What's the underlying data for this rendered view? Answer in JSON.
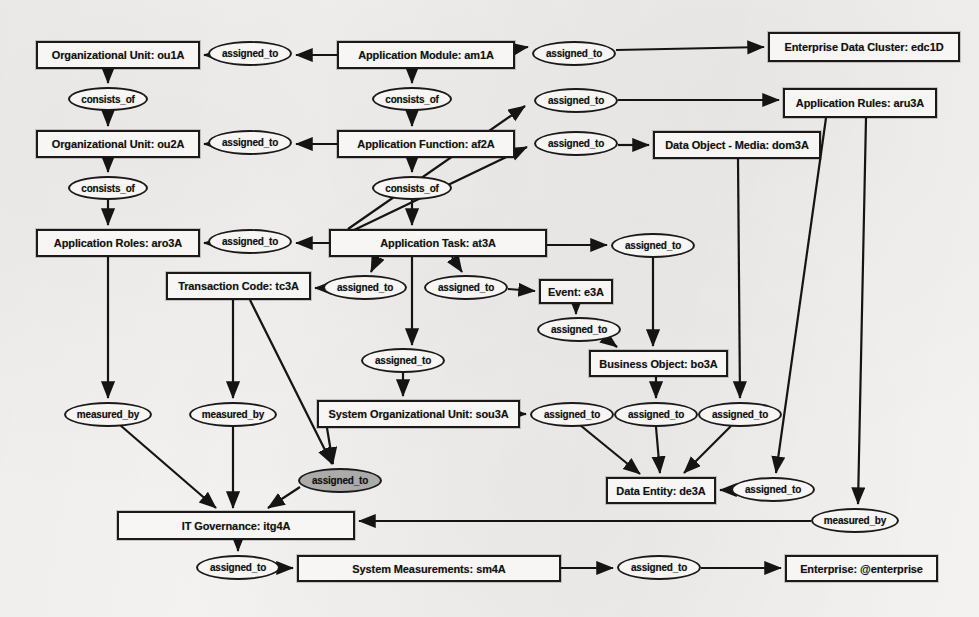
{
  "diagram": {
    "background_color": "#f2f0ee",
    "node_fill": "#f7f6f4",
    "node_stroke": "#1a1a1a",
    "edge_label_fill": "#f7f6f4",
    "edge_label_highlight_fill": "#ababab",
    "relation_labels": [
      "assigned_to",
      "consists_of",
      "measured_by"
    ],
    "nodes": [
      {
        "id": "ou1A",
        "label": "Organizational Unit: ou1A",
        "x": 36,
        "y": 41,
        "w": 164,
        "h": 28
      },
      {
        "id": "am1A",
        "label": "Application Module: am1A",
        "x": 337,
        "y": 41,
        "w": 178,
        "h": 28
      },
      {
        "id": "edc1D",
        "label": "Enterprise Data Cluster: edc1D",
        "x": 768,
        "y": 32,
        "w": 192,
        "h": 30
      },
      {
        "id": "ou2A",
        "label": "Organizational Unit: ou2A",
        "x": 36,
        "y": 130,
        "w": 164,
        "h": 28
      },
      {
        "id": "af2A",
        "label": "Application Function: af2A",
        "x": 337,
        "y": 130,
        "w": 178,
        "h": 28
      },
      {
        "id": "aru3A",
        "label": "Application Rules: aru3A",
        "x": 783,
        "y": 88,
        "w": 154,
        "h": 30
      },
      {
        "id": "dom3A",
        "label": "Data Object - Media: dom3A",
        "x": 653,
        "y": 131,
        "w": 168,
        "h": 28
      },
      {
        "id": "aro3A",
        "label": "Application Roles: aro3A",
        "x": 36,
        "y": 229,
        "w": 164,
        "h": 28
      },
      {
        "id": "at3A",
        "label": "Application Task: at3A",
        "x": 329,
        "y": 229,
        "w": 218,
        "h": 28
      },
      {
        "id": "tc3A",
        "label": "Transaction Code: tc3A",
        "x": 166,
        "y": 272,
        "w": 145,
        "h": 28
      },
      {
        "id": "e3A",
        "label": "Event: e3A",
        "x": 539,
        "y": 279,
        "w": 74,
        "h": 25
      },
      {
        "id": "bo3A",
        "label": "Business Object: bo3A",
        "x": 589,
        "y": 350,
        "w": 139,
        "h": 27
      },
      {
        "id": "sou3A",
        "label": "System Organizational Unit: sou3A",
        "x": 317,
        "y": 400,
        "w": 203,
        "h": 28
      },
      {
        "id": "de3A",
        "label": "Data Entity: de3A",
        "x": 606,
        "y": 477,
        "w": 110,
        "h": 27
      },
      {
        "id": "itg4A",
        "label": "IT Governance: itg4A",
        "x": 117,
        "y": 511,
        "w": 238,
        "h": 29
      },
      {
        "id": "sm4A",
        "label": "System Measurements: sm4A",
        "x": 297,
        "y": 555,
        "w": 264,
        "h": 27
      },
      {
        "id": "ent",
        "label": "Enterprise: @enterprise",
        "x": 785,
        "y": 555,
        "w": 153,
        "h": 27
      }
    ],
    "edge_labels": [
      {
        "id": "el1",
        "text": "assigned_to",
        "x": 208,
        "y": 41,
        "w": 84,
        "h": 25,
        "filled": false
      },
      {
        "id": "el2",
        "text": "assigned_to",
        "x": 532,
        "y": 41,
        "w": 84,
        "h": 25,
        "filled": false
      },
      {
        "id": "el3",
        "text": "consists_of",
        "x": 68,
        "y": 87,
        "w": 80,
        "h": 24,
        "filled": false
      },
      {
        "id": "el4",
        "text": "consists_of",
        "x": 372,
        "y": 87,
        "w": 80,
        "h": 24,
        "filled": false
      },
      {
        "id": "el5",
        "text": "assigned_to",
        "x": 534,
        "y": 88,
        "w": 84,
        "h": 25,
        "filled": false
      },
      {
        "id": "el6",
        "text": "assigned_to",
        "x": 208,
        "y": 130,
        "w": 84,
        "h": 25,
        "filled": false
      },
      {
        "id": "el7",
        "text": "assigned_to",
        "x": 534,
        "y": 131,
        "w": 84,
        "h": 25,
        "filled": false
      },
      {
        "id": "el8",
        "text": "consists_of",
        "x": 68,
        "y": 176,
        "w": 80,
        "h": 24,
        "filled": false
      },
      {
        "id": "el9",
        "text": "consists_of",
        "x": 372,
        "y": 176,
        "w": 80,
        "h": 24,
        "filled": false
      },
      {
        "id": "el10",
        "text": "assigned_to",
        "x": 208,
        "y": 229,
        "w": 84,
        "h": 25,
        "filled": false
      },
      {
        "id": "el11",
        "text": "assigned_to",
        "x": 611,
        "y": 233,
        "w": 84,
        "h": 25,
        "filled": false
      },
      {
        "id": "el12",
        "text": "assigned_to",
        "x": 323,
        "y": 275,
        "w": 84,
        "h": 25,
        "filled": false
      },
      {
        "id": "el13",
        "text": "assigned_to",
        "x": 424,
        "y": 275,
        "w": 84,
        "h": 25,
        "filled": false
      },
      {
        "id": "el14",
        "text": "assigned_to",
        "x": 537,
        "y": 317,
        "w": 84,
        "h": 25,
        "filled": false
      },
      {
        "id": "el15",
        "text": "assigned_to",
        "x": 361,
        "y": 348,
        "w": 84,
        "h": 25,
        "filled": false
      },
      {
        "id": "el16",
        "text": "measured_by",
        "x": 64,
        "y": 402,
        "w": 88,
        "h": 25,
        "filled": false
      },
      {
        "id": "el17",
        "text": "measured_by",
        "x": 189,
        "y": 402,
        "w": 88,
        "h": 25,
        "filled": false
      },
      {
        "id": "el18",
        "text": "assigned_to",
        "x": 530,
        "y": 402,
        "w": 84,
        "h": 25,
        "filled": false
      },
      {
        "id": "el19",
        "text": "assigned_to",
        "x": 614,
        "y": 402,
        "w": 84,
        "h": 25,
        "filled": false
      },
      {
        "id": "el20",
        "text": "assigned_to",
        "x": 698,
        "y": 402,
        "w": 84,
        "h": 25,
        "filled": false
      },
      {
        "id": "el21",
        "text": "assigned_to",
        "x": 298,
        "y": 468,
        "w": 84,
        "h": 25,
        "filled": true
      },
      {
        "id": "el22",
        "text": "assigned_to",
        "x": 731,
        "y": 477,
        "w": 84,
        "h": 25,
        "filled": false
      },
      {
        "id": "el23",
        "text": "measured_by",
        "x": 811,
        "y": 508,
        "w": 88,
        "h": 25,
        "filled": false
      },
      {
        "id": "el24",
        "text": "assigned_to",
        "x": 196,
        "y": 555,
        "w": 84,
        "h": 25,
        "filled": false
      },
      {
        "id": "el25",
        "text": "assigned_to",
        "x": 617,
        "y": 555,
        "w": 84,
        "h": 25,
        "filled": false
      }
    ],
    "edges": [
      {
        "from": "am1A",
        "to": "el1",
        "relation": "assigned_to"
      },
      {
        "from": "el1",
        "to": "ou1A",
        "relation": "assigned_to"
      },
      {
        "from": "am1A",
        "to": "el2",
        "relation": "assigned_to"
      },
      {
        "from": "el2",
        "to": "edc1D",
        "relation": "assigned_to"
      },
      {
        "from": "ou1A",
        "to": "el3",
        "relation": "consists_of"
      },
      {
        "from": "el3",
        "to": "ou2A",
        "relation": "consists_of"
      },
      {
        "from": "am1A",
        "to": "el4",
        "relation": "consists_of"
      },
      {
        "from": "el4",
        "to": "af2A",
        "relation": "consists_of"
      },
      {
        "from": "at3A",
        "to": "el5",
        "relation": "assigned_to"
      },
      {
        "from": "el5",
        "to": "aru3A",
        "relation": "assigned_to"
      },
      {
        "from": "af2A",
        "to": "el6",
        "relation": "assigned_to"
      },
      {
        "from": "el6",
        "to": "ou2A",
        "relation": "assigned_to"
      },
      {
        "from": "at3A",
        "to": "el7",
        "relation": "assigned_to"
      },
      {
        "from": "el7",
        "to": "dom3A",
        "relation": "assigned_to"
      },
      {
        "from": "ou2A",
        "to": "el8",
        "relation": "consists_of"
      },
      {
        "from": "el8",
        "to": "aro3A",
        "relation": "consists_of"
      },
      {
        "from": "af2A",
        "to": "el9",
        "relation": "consists_of"
      },
      {
        "from": "el9",
        "to": "at3A",
        "relation": "consists_of"
      },
      {
        "from": "at3A",
        "to": "el10",
        "relation": "assigned_to"
      },
      {
        "from": "el10",
        "to": "aro3A",
        "relation": "assigned_to"
      },
      {
        "from": "at3A",
        "to": "el11",
        "relation": "assigned_to"
      },
      {
        "from": "el11",
        "to": "bo3A",
        "relation": "assigned_to"
      },
      {
        "from": "at3A",
        "to": "el12",
        "relation": "assigned_to"
      },
      {
        "from": "el12",
        "to": "tc3A",
        "relation": "assigned_to"
      },
      {
        "from": "at3A",
        "to": "el13",
        "relation": "assigned_to"
      },
      {
        "from": "el13",
        "to": "e3A",
        "relation": "assigned_to"
      },
      {
        "from": "e3A",
        "to": "el14",
        "relation": "assigned_to"
      },
      {
        "from": "el14",
        "to": "bo3A",
        "relation": "assigned_to"
      },
      {
        "from": "at3A",
        "to": "el15",
        "relation": "assigned_to"
      },
      {
        "from": "el15",
        "to": "sou3A",
        "relation": "assigned_to"
      },
      {
        "from": "aro3A",
        "to": "el16",
        "relation": "measured_by"
      },
      {
        "from": "el16",
        "to": "itg4A",
        "relation": "measured_by"
      },
      {
        "from": "tc3A",
        "to": "el17",
        "relation": "measured_by"
      },
      {
        "from": "el17",
        "to": "itg4A",
        "relation": "measured_by"
      },
      {
        "from": "sou3A",
        "to": "el18",
        "relation": "assigned_to"
      },
      {
        "from": "el18",
        "to": "de3A",
        "relation": "assigned_to"
      },
      {
        "from": "bo3A",
        "to": "el19",
        "relation": "assigned_to"
      },
      {
        "from": "el19",
        "to": "de3A",
        "relation": "assigned_to"
      },
      {
        "from": "dom3A",
        "to": "el20",
        "relation": "assigned_to"
      },
      {
        "from": "el20",
        "to": "de3A",
        "relation": "assigned_to"
      },
      {
        "from": "tc3A",
        "to": "el21",
        "relation": "assigned_to"
      },
      {
        "from": "sou3A",
        "to": "el21",
        "relation": "assigned_to"
      },
      {
        "from": "el21",
        "to": "itg4A",
        "relation": "assigned_to"
      },
      {
        "from": "aru3A",
        "to": "el22",
        "relation": "assigned_to"
      },
      {
        "from": "el22",
        "to": "de3A",
        "relation": "assigned_to"
      },
      {
        "from": "aru3A",
        "to": "el23",
        "relation": "measured_by"
      },
      {
        "from": "el23",
        "to": "itg4A",
        "relation": "measured_by"
      },
      {
        "from": "itg4A",
        "to": "el24",
        "relation": "assigned_to"
      },
      {
        "from": "el24",
        "to": "sm4A",
        "relation": "assigned_to"
      },
      {
        "from": "sm4A",
        "to": "el25",
        "relation": "assigned_to"
      },
      {
        "from": "el25",
        "to": "ent",
        "relation": "assigned_to"
      }
    ]
  }
}
